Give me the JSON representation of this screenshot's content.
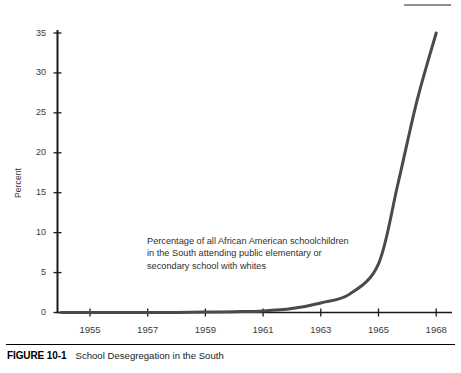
{
  "figure": {
    "number_label": "FIGURE 10-1",
    "title": "School Desegregation in the South"
  },
  "annotation": {
    "line1": "Percentage of all African American schoolchildren",
    "line2": "in the South attending public elementary or",
    "line3": "secondary school with whites"
  },
  "colors": {
    "line": "#4a4a4a",
    "axis": "#1a1a1a",
    "text": "#333333",
    "top_rule": "#8f8f8f"
  },
  "chart_data": {
    "type": "line",
    "title": "School Desegregation in the South",
    "xlabel": "",
    "ylabel": "Percent",
    "grid": false,
    "legend": null,
    "annotations": [
      "Percentage of all African American schoolchildren in the South attending public elementary or secondary school with whites"
    ],
    "xlim": [
      1954,
      1968
    ],
    "ylim": [
      0,
      35
    ],
    "ytick_labels": [
      "0",
      "5",
      "10",
      "15",
      "20",
      "25",
      "30",
      "35"
    ],
    "yticks": [
      0,
      5,
      10,
      15,
      20,
      25,
      30,
      35
    ],
    "xtick_labels": [
      "1955",
      "1957",
      "1959",
      "1961",
      "1963",
      "1965",
      "1968"
    ],
    "xticks": [
      1955,
      1957,
      1959,
      1961,
      1963,
      1965,
      1968
    ],
    "series": [
      {
        "name": "Percentage of all African American schoolchildren in the South attending public elementary or secondary school with whites",
        "x": [
          1954,
          1955,
          1956,
          1957,
          1958,
          1959,
          1960,
          1961,
          1962,
          1963,
          1964,
          1965,
          1966,
          1967,
          1968
        ],
        "values": [
          0.0,
          0.0,
          0.0,
          0.0,
          0.0,
          0.05,
          0.1,
          0.2,
          0.5,
          1.2,
          2.3,
          6.1,
          16.0,
          26.5,
          35.0
        ]
      }
    ]
  }
}
